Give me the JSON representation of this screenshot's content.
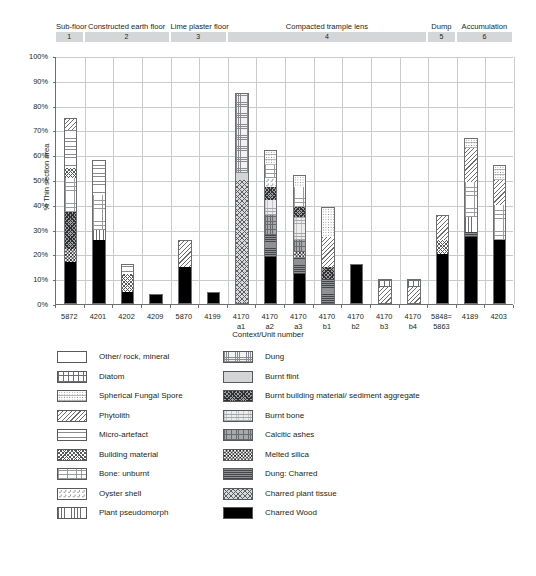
{
  "chart_data": {
    "type": "bar",
    "subtype": "stacked-percentage",
    "title": "",
    "xlabel": "Context/Unit number",
    "ylabel": "% Thin section area",
    "ylim": [
      0,
      100
    ],
    "ytick_labels": [
      "0%",
      "10%",
      "20%",
      "30%",
      "40%",
      "50%",
      "60%",
      "70%",
      "80%",
      "90%",
      "100%"
    ],
    "ytick_values": [
      0,
      10,
      20,
      30,
      40,
      50,
      60,
      70,
      80,
      90,
      100
    ],
    "grid": "horizontal-and-vertical",
    "legend_position": "below-plot-two-columns",
    "categories": [
      "5872",
      "4201",
      "4202",
      "4209",
      "5870",
      "4199",
      "4170\na1",
      "4170\na2",
      "4170\na3",
      "4170\nb1",
      "4170\nb2",
      "4170\nb3",
      "4170\nb4",
      "5848=\n5863",
      "4189",
      "4203"
    ],
    "group_bands": [
      {
        "number": "1",
        "label": "Sub-floor",
        "first_index": 0,
        "last_index": 0
      },
      {
        "number": "2",
        "label": "Constructed earth floor",
        "first_index": 1,
        "last_index": 3
      },
      {
        "number": "3",
        "label": "Lime plaster floor",
        "first_index": 4,
        "last_index": 5
      },
      {
        "number": "4",
        "label": "Compacted trample lens",
        "first_index": 6,
        "last_index": 12
      },
      {
        "number": "5",
        "label": "Dump",
        "first_index": 13,
        "last_index": 13
      },
      {
        "number": "6",
        "label": "Accumulation",
        "first_index": 14,
        "last_index": 15
      }
    ],
    "series": [
      {
        "name": "Charred Wood",
        "key": "wood",
        "values": [
          17,
          26,
          5,
          4,
          15,
          5,
          0,
          19,
          12,
          0,
          16,
          0,
          0,
          20,
          27,
          26
        ]
      },
      {
        "name": "Charred plant tissue",
        "key": "cpt",
        "values": [
          0,
          0,
          0,
          0,
          0,
          0,
          50,
          0,
          0,
          0,
          0,
          0,
          0,
          0,
          0,
          0
        ]
      },
      {
        "name": "Dung: Charred",
        "key": "dungch",
        "values": [
          0,
          0,
          0,
          0,
          0,
          0,
          0,
          9,
          7,
          10,
          0,
          0,
          0,
          0,
          2,
          0
        ]
      },
      {
        "name": "Melted silica",
        "key": "melted",
        "values": [
          5,
          0,
          0,
          0,
          0,
          0,
          0,
          0,
          2,
          0,
          0,
          0,
          0,
          0,
          0,
          0
        ]
      },
      {
        "name": "Calcitic ashes",
        "key": "calc",
        "values": [
          0,
          0,
          0,
          0,
          0,
          0,
          0,
          8,
          5,
          0,
          0,
          0,
          0,
          0,
          0,
          0
        ]
      },
      {
        "name": "Burnt bone",
        "key": "bbone",
        "values": [
          0,
          0,
          0,
          0,
          0,
          0,
          0,
          6,
          9,
          0,
          0,
          0,
          0,
          0,
          0,
          0
        ]
      },
      {
        "name": "Burnt building material/ sediment aggregate",
        "key": "bbm",
        "values": [
          15,
          0,
          0,
          0,
          0,
          0,
          0,
          5,
          4,
          5,
          0,
          0,
          0,
          0,
          0,
          0
        ]
      },
      {
        "name": "Burnt flint",
        "key": "flint",
        "values": [
          0,
          0,
          0,
          0,
          0,
          0,
          3,
          0,
          0,
          0,
          0,
          0,
          0,
          0,
          0,
          0
        ]
      },
      {
        "name": "Dung",
        "key": "dung",
        "values": [
          0,
          0,
          0,
          0,
          0,
          0,
          32,
          0,
          0,
          0,
          0,
          0,
          0,
          0,
          0,
          0
        ]
      },
      {
        "name": "Plant pseudomorph",
        "key": "pseudo",
        "values": [
          0,
          4,
          0,
          0,
          0,
          0,
          0,
          0,
          0,
          0,
          0,
          0,
          0,
          0,
          6,
          0
        ]
      },
      {
        "name": "Oyster shell",
        "key": "oyster",
        "values": [
          0,
          0,
          0,
          0,
          0,
          0,
          0,
          4,
          0,
          0,
          0,
          0,
          0,
          0,
          0,
          0
        ]
      },
      {
        "name": "Bone: unburnt",
        "key": "bone",
        "values": [
          14,
          14,
          0,
          0,
          0,
          0,
          0,
          5,
          8,
          0,
          0,
          0,
          0,
          0,
          14,
          14
        ]
      },
      {
        "name": "Building material",
        "key": "bldg",
        "values": [
          4,
          0,
          7,
          0,
          0,
          0,
          0,
          0,
          0,
          0,
          0,
          0,
          0,
          6,
          0,
          0
        ]
      },
      {
        "name": "Micro-artefact",
        "key": "micro",
        "values": [
          15,
          14,
          4,
          0,
          0,
          0,
          0,
          0,
          0,
          0,
          0,
          0,
          0,
          0,
          0,
          0
        ]
      },
      {
        "name": "Phytolith",
        "key": "phyto",
        "values": [
          5,
          0,
          0,
          0,
          11,
          0,
          0,
          0,
          0,
          12,
          0,
          7,
          7,
          10,
          14,
          10
        ]
      },
      {
        "name": "Spherical Fungal Spore",
        "key": "sfs",
        "values": [
          0,
          0,
          0,
          0,
          0,
          0,
          0,
          6,
          5,
          12,
          0,
          0,
          0,
          0,
          4,
          6
        ]
      },
      {
        "name": "Diatom",
        "key": "diatom",
        "values": [
          0,
          0,
          0,
          0,
          0,
          0,
          0,
          0,
          0,
          0,
          0,
          3,
          3,
          0,
          0,
          0
        ]
      },
      {
        "name": "Other/ rock, mineral",
        "key": "other",
        "values": [
          25,
          42,
          84,
          96,
          74,
          95,
          15,
          38,
          48,
          61,
          84,
          90,
          90,
          64,
          33,
          44
        ]
      }
    ],
    "bar_totals_visible": [
      75,
      58,
      16,
      4,
      26,
      5,
      85,
      62,
      52,
      39,
      16,
      10,
      10,
      36,
      67,
      56
    ]
  },
  "legend": {
    "column_left": [
      {
        "label": "Other/ rock, mineral",
        "key": "other"
      },
      {
        "label": "Diatom",
        "key": "diatom"
      },
      {
        "label": "Spherical Fungal Spore",
        "key": "sfs"
      },
      {
        "label": "Phytolith",
        "key": "phyto"
      },
      {
        "label": "Micro-artefact",
        "key": "micro"
      },
      {
        "label": "Building material",
        "key": "bldg"
      },
      {
        "label": "Bone: unburnt",
        "key": "bone"
      },
      {
        "label": "Oyster shell",
        "key": "oyster"
      },
      {
        "label": "Plant pseudomorph",
        "key": "pseudo"
      }
    ],
    "column_right": [
      {
        "label": "Dung",
        "key": "dung"
      },
      {
        "label": "Burnt flint",
        "key": "flint"
      },
      {
        "label": "Burnt building material/ sediment aggregate",
        "key": "bbm"
      },
      {
        "label": "Burnt bone",
        "key": "bbone"
      },
      {
        "label": "Calcitic ashes",
        "key": "calc"
      },
      {
        "label": "Melted silica",
        "key": "melted"
      },
      {
        "label": "Dung: Charred",
        "key": "dungch"
      },
      {
        "label": "Charred plant tissue",
        "key": "cpt"
      },
      {
        "label": "Charred Wood",
        "key": "wood"
      }
    ]
  },
  "colors": {
    "text": "#231f20",
    "axis": "#6d6e71",
    "grid": "#c9cacc",
    "band": "#d4d6d8",
    "background": "#ffffff"
  }
}
